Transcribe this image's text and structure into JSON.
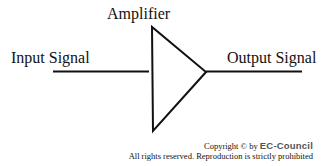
{
  "diagram": {
    "title": "Amplifier",
    "input_label": "Input Signal",
    "output_label": "Output Signal",
    "component": "amplifier-triangle"
  },
  "footer": {
    "copyright_prefix": "Copyright © by",
    "brand": "EC-Council",
    "rights": "All rights reserved. Reproduction is strictly prohibited"
  }
}
